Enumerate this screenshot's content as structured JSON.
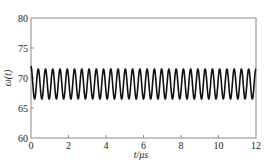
{
  "chart_data": {
    "type": "line",
    "title": "",
    "xlabel": "t/μs",
    "ylabel": "ω(t)",
    "xlim": [
      0,
      12
    ],
    "ylim": [
      60,
      80
    ],
    "xticks": [
      0,
      2,
      4,
      6,
      8,
      10,
      12
    ],
    "yticks": [
      60,
      65,
      70,
      75,
      80
    ],
    "xtick_labels": [
      "0",
      "2",
      "4",
      "6",
      "8",
      "10",
      "12"
    ],
    "ytick_labels": [
      "60",
      "65",
      "70",
      "75",
      "80"
    ],
    "grid": false,
    "legend": null,
    "series": [
      {
        "name": "ω(t)",
        "description": "Steady sinusoidal oscillation about ~69, amplitude ~2.5 (min ~66.5, max ~71.5), starting near 72 at t=0, ~31 cycles over 0–12 μs",
        "mean": 69,
        "amplitude": 2.5,
        "period_us": 0.387,
        "t_start": 0,
        "t_end": 12,
        "initial_value": 72,
        "min": 66.5,
        "max": 71.5
      }
    ],
    "caption": ""
  },
  "labels": {
    "xlabel": "t/μs",
    "ylabel": "ω(t)"
  }
}
